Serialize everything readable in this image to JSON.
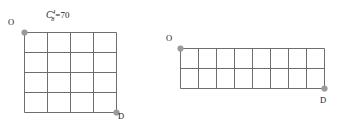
{
  "figures": [
    {
      "id": "left",
      "formula": {
        "base": "C",
        "superscript": "4",
        "subscript": "8",
        "equals": "=",
        "value": "70",
        "full_text": "C⁸₄=70"
      },
      "grid": {
        "columns": 4,
        "rows": 4,
        "cell_width": 23,
        "cell_height": 20,
        "line_color": "#6e6e6e",
        "line_width": 1.0
      },
      "origin": {
        "label": "O",
        "marker_color": "#9a9a9a",
        "position": "top-left"
      },
      "destination": {
        "label": "D",
        "marker_color": "#9a9a9a",
        "position": "bottom-right"
      }
    },
    {
      "id": "right",
      "formula": {
        "base": "C",
        "superscript": "2",
        "subscript": "10",
        "equals": "=",
        "value": "45",
        "full_text": "C¹⁰²=45"
      },
      "grid": {
        "columns": 8,
        "rows": 2,
        "cell_width": 18,
        "cell_height": 20,
        "line_color": "#6e6e6e",
        "line_width": 1.0
      },
      "origin": {
        "label": "O",
        "marker_color": "#9a9a9a",
        "position": "top-left"
      },
      "destination": {
        "label": "D",
        "marker_color": "#9a9a9a",
        "position": "bottom-right"
      }
    }
  ],
  "colors": {
    "background": "#ffffff",
    "grid_line": "#6e6e6e",
    "marker": "#9a9a9a",
    "text": "#1a1a1a"
  }
}
